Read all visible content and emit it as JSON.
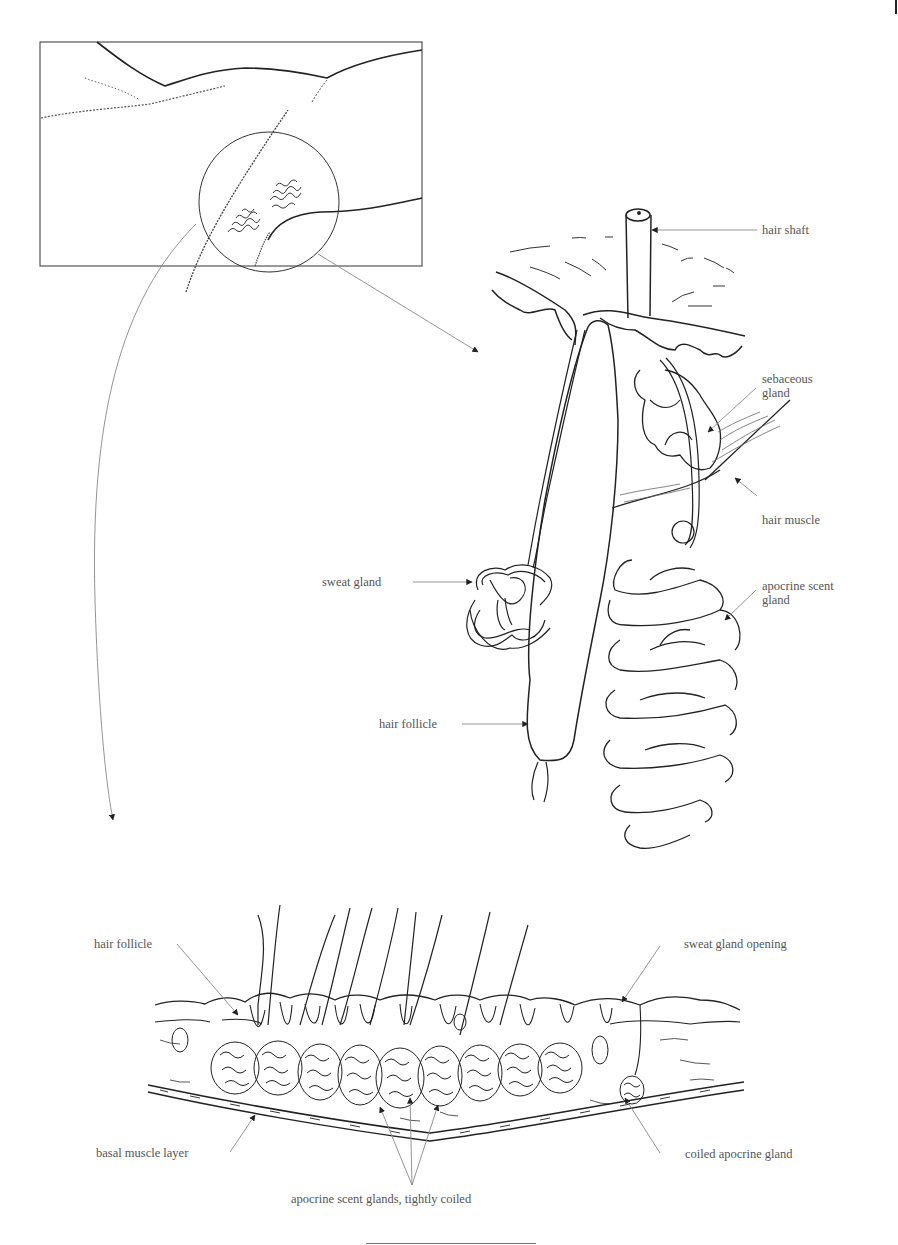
{
  "figure": {
    "colors": {
      "ink": "#222222",
      "leader": "#888888",
      "label": "#555555"
    },
    "inset": {
      "description": "Body region with magnified circle over glandular patch"
    },
    "follicle_detail": {
      "labels": [
        {
          "id": "hair-shaft",
          "text": "hair shaft"
        },
        {
          "id": "sebaceous-gland",
          "line1": "sebaceous",
          "line2": "gland"
        },
        {
          "id": "hair-muscle",
          "text": "hair muscle"
        },
        {
          "id": "sweat-gland",
          "text": "sweat gland"
        },
        {
          "id": "apocrine-scent-gland",
          "line1": "apocrine scent",
          "line2": "gland"
        },
        {
          "id": "hair-follicle",
          "text": "hair follicle"
        }
      ]
    },
    "cross_section": {
      "labels": [
        {
          "id": "hair-follicle",
          "text": "hair follicle"
        },
        {
          "id": "sweat-gland-opening",
          "text": "sweat gland opening"
        },
        {
          "id": "basal-muscle-layer",
          "text": "basal muscle layer"
        },
        {
          "id": "coiled-apocrine-gland",
          "text": "coiled apocrine gland"
        },
        {
          "id": "apocrine-scent-glands",
          "text": "apocrine scent glands, tightly coiled"
        }
      ]
    }
  }
}
